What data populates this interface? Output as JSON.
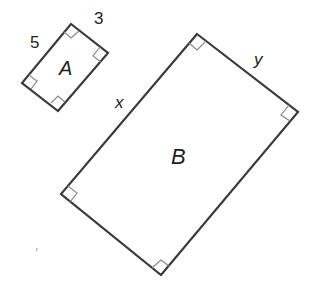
{
  "figure": {
    "colors": {
      "stroke": "#3a3a3a",
      "right_angle_mark": "#8a8a8a",
      "text": "#231f20"
    }
  },
  "rectangle_a": {
    "label": "A",
    "side_labels": {
      "left_side": "5",
      "right_side": "3"
    }
  },
  "rectangle_b": {
    "label": "B",
    "side_labels": {
      "left_side": "x",
      "right_side": "y"
    }
  }
}
